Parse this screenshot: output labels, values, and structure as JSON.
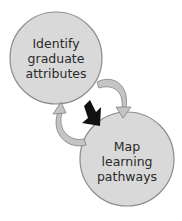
{
  "diagram": {
    "nodes": [
      {
        "id": "identify",
        "lines": [
          "Identify",
          "graduate",
          "attributes"
        ]
      },
      {
        "id": "map",
        "lines": [
          "Map",
          "learning",
          "pathways"
        ]
      }
    ],
    "colors": {
      "circle_fill": "#d9d9d9",
      "circle_stroke": "#8c8c8c",
      "cycle_arrow_fill": "#c4c4c4",
      "cycle_arrow_stroke": "#808080",
      "main_arrow_fill": "#111111",
      "text": "#2a2a2a"
    },
    "arrows": [
      {
        "type": "cycle",
        "from": "identify",
        "to": "map",
        "direction": "clockwise-right"
      },
      {
        "type": "cycle",
        "from": "map",
        "to": "identify",
        "direction": "clockwise-left"
      },
      {
        "type": "main",
        "from": "identify",
        "to": "map"
      }
    ]
  }
}
